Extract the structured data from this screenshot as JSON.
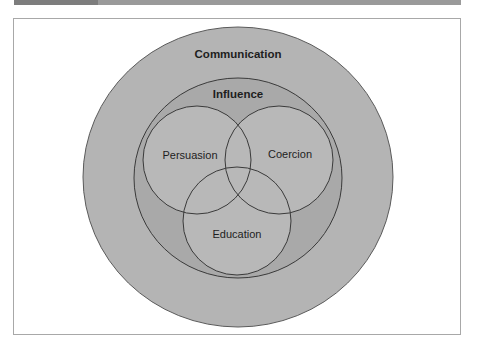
{
  "figure": {
    "header_strip": {
      "color": "#9a9a9a",
      "tab_color": "#7d7d7d"
    },
    "frame": {
      "border_color": "#a8a8a8",
      "background": "#ffffff"
    },
    "diagram": {
      "type": "nested-venn",
      "sets": [
        {
          "id": "communication",
          "label": "Communication",
          "weight": "bold",
          "cx": 238,
          "cy": 177,
          "rx": 155,
          "ry": 150,
          "fill": "#b4b4b4",
          "label_x": 238,
          "label_y": 58
        },
        {
          "id": "influence",
          "label": "Influence",
          "weight": "bold",
          "cx": 238,
          "cy": 178,
          "rx": 104,
          "ry": 100,
          "fill": "#a9a9a9",
          "label_x": 238,
          "label_y": 98
        },
        {
          "id": "persuasion",
          "label": "Persuasion",
          "weight": "normal",
          "cx": 197,
          "cy": 160,
          "r": 54,
          "fill": "#b8b8b8",
          "label_x": 190,
          "label_y": 159
        },
        {
          "id": "coercion",
          "label": "Coercion",
          "weight": "normal",
          "cx": 279,
          "cy": 160,
          "r": 54,
          "fill": "#b8b8b8",
          "label_x": 290,
          "label_y": 158
        },
        {
          "id": "education",
          "label": "Education",
          "weight": "normal",
          "cx": 237,
          "cy": 221,
          "r": 54,
          "fill": "#b8b8b8",
          "label_x": 237,
          "label_y": 238
        }
      ],
      "stroke_color": "#3a3a3a",
      "outer_stroke_color": "#5a5a5a",
      "relationships": [
        "Influence is a subset of Communication",
        "Persuasion, Coercion and Education are subsets of Influence",
        "Persuasion, Coercion and Education mutually overlap"
      ]
    }
  }
}
